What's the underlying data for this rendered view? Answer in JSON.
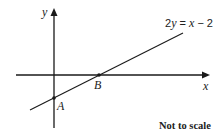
{
  "figure": {
    "axes": {
      "x_label": "x",
      "y_label": "y"
    },
    "line": {
      "equation_parts": [
        "2",
        "y",
        " = ",
        "x",
        " − 2"
      ],
      "equation": "2y = x − 2"
    },
    "points": [
      {
        "label": "A",
        "description": "y-intercept of line"
      },
      {
        "label": "B",
        "description": "x-intercept of line"
      }
    ],
    "note": "Not to scale",
    "colors": {
      "stroke": "#1a1a1a",
      "text": "#222222",
      "background": "#ffffff"
    }
  }
}
